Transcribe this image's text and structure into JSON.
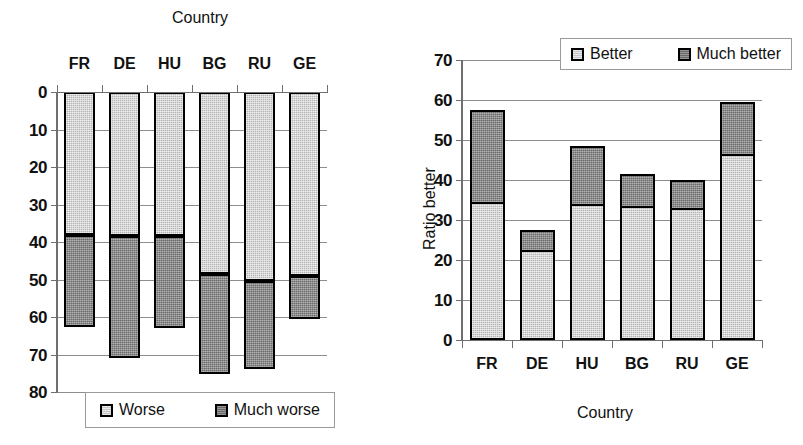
{
  "chart_data": [
    {
      "id": "worse-chart",
      "type": "bar",
      "stacked": true,
      "title": "",
      "xlabel": "Country",
      "ylabel": "",
      "xlabel_position": "top",
      "ylim": [
        0,
        80
      ],
      "y_inverted": true,
      "yticks": [
        "0",
        "10",
        "20",
        "30",
        "40",
        "50",
        "60",
        "70",
        "80"
      ],
      "grid": true,
      "legend_position": "bottom",
      "categories": [
        "FR",
        "DE",
        "HU",
        "BG",
        "RU",
        "GE"
      ],
      "series": [
        {
          "name": "Worse",
          "values": [
            38.0,
            38.5,
            38.5,
            48.5,
            50.5,
            49.0
          ]
        },
        {
          "name": "Much worse",
          "values": [
            24.0,
            32.0,
            24.0,
            26.0,
            23.0,
            11.0
          ]
        }
      ],
      "totals": [
        62.0,
        70.5,
        62.5,
        74.5,
        73.5,
        60.0
      ],
      "legend": [
        {
          "label": "Worse",
          "swatch": "light"
        },
        {
          "label": "Much worse",
          "swatch": "dark"
        }
      ]
    },
    {
      "id": "better-chart",
      "type": "bar",
      "stacked": true,
      "title": "",
      "xlabel": "Country",
      "ylabel": "Ratio better",
      "xlabel_position": "bottom",
      "ylim": [
        0,
        70
      ],
      "y_inverted": false,
      "yticks": [
        "0",
        "10",
        "20",
        "30",
        "40",
        "50",
        "60",
        "70"
      ],
      "grid": true,
      "legend_position": "top",
      "categories": [
        "FR",
        "DE",
        "HU",
        "BG",
        "RU",
        "GE"
      ],
      "series": [
        {
          "name": "Better",
          "values": [
            34.5,
            22.5,
            34.0,
            33.5,
            33.0,
            46.5
          ]
        },
        {
          "name": "Much better",
          "values": [
            23.0,
            5.0,
            14.5,
            8.0,
            7.0,
            13.0
          ]
        }
      ],
      "totals": [
        57.5,
        27.5,
        48.5,
        41.5,
        40.0,
        59.5
      ],
      "legend": [
        {
          "label": "Better",
          "swatch": "light"
        },
        {
          "label": "Much better",
          "swatch": "dark"
        }
      ]
    }
  ],
  "colors": {
    "light_segment": "#b4b4b4",
    "dark_segment": "#6a6a6a",
    "outline": "#000000",
    "gridline": "#8d8d8d",
    "axis": "#6f6f6f",
    "text": "#111111",
    "background": "#ffffff"
  }
}
